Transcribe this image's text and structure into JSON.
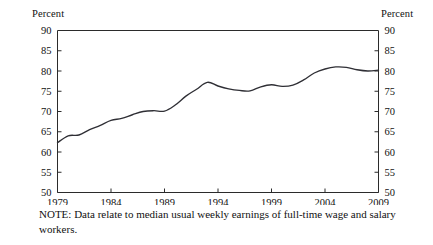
{
  "chart_data": {
    "type": "line",
    "title": "",
    "xlabel": "",
    "ylabel": "Percent",
    "y_axis_title_left": "Percent",
    "y_axis_title_right": "Percent",
    "ylim": [
      50,
      90
    ],
    "xlim": [
      1979,
      2009
    ],
    "yticks": [
      50,
      55,
      60,
      65,
      70,
      75,
      80,
      85,
      90
    ],
    "ytick_labels": [
      "50",
      "55",
      "60",
      "65",
      "70",
      "75",
      "80",
      "85",
      "90"
    ],
    "xticks": [
      1979,
      1984,
      1989,
      1994,
      1999,
      2004,
      2009
    ],
    "xtick_labels": [
      "1979",
      "1984",
      "1989",
      "1994",
      "1999",
      "2004",
      "2009"
    ],
    "grid": false,
    "legend": false,
    "legend_position": "none",
    "line_color": "#2f2f35",
    "series": [
      {
        "name": "Women's earnings as a percent of men's",
        "x": [
          1979,
          1980,
          1981,
          1982,
          1983,
          1984,
          1985,
          1986,
          1987,
          1988,
          1989,
          1990,
          1991,
          1992,
          1993,
          1994,
          1995,
          1996,
          1997,
          1998,
          1999,
          2000,
          2001,
          2002,
          2003,
          2004,
          2005,
          2006,
          2007,
          2008,
          2009
        ],
        "values": [
          62.3,
          64.0,
          64.2,
          65.5,
          66.6,
          67.8,
          68.3,
          69.2,
          70.0,
          70.2,
          70.1,
          71.6,
          73.8,
          75.5,
          77.2,
          76.3,
          75.6,
          75.2,
          75.1,
          76.1,
          76.6,
          76.2,
          76.5,
          77.8,
          79.5,
          80.5,
          81.0,
          80.9,
          80.3,
          80.0,
          80.2
        ]
      }
    ],
    "note": "NOTE: Data relate to median usual weekly earnings of full-time wage and salary workers."
  },
  "figure": {
    "note_text": "NOTE: Data relate to median usual weekly earnings of full-time wage and salary workers."
  }
}
